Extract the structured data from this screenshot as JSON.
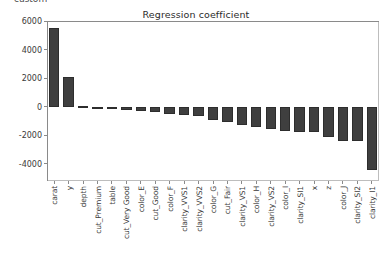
{
  "top_fragment": "custom",
  "chart_data": {
    "type": "bar",
    "title": "Regression coefficient",
    "xlabel": "",
    "ylabel": "",
    "ylim": [
      -5200,
      6000
    ],
    "yticks": [
      6000,
      4000,
      2000,
      0,
      -2000,
      -4000
    ],
    "ytick_labels": [
      "6000",
      "4000",
      "2000",
      "0",
      "-2000",
      "-4000"
    ],
    "grid": false,
    "legend": null,
    "bar_color": "#3f3f3f",
    "categories": [
      "carat",
      "y",
      "depth",
      "cut_Premium",
      "table",
      "cut_Very Good",
      "color_E",
      "cut_Good",
      "color_F",
      "clarity_VVS1",
      "clarity_VVS2",
      "color_G",
      "cut_Fair",
      "clarity_VS1",
      "color_H",
      "clarity_VS2",
      "color_I",
      "clarity_SI1",
      "x",
      "z",
      "color_J",
      "clarity_SI2",
      "clarity_I1"
    ],
    "values": [
      5500,
      2100,
      60,
      -60,
      -110,
      -230,
      -330,
      -400,
      -490,
      -570,
      -640,
      -950,
      -1080,
      -1280,
      -1400,
      -1560,
      -1700,
      -1760,
      -1770,
      -2150,
      -2400,
      -2420,
      -4450
    ]
  }
}
